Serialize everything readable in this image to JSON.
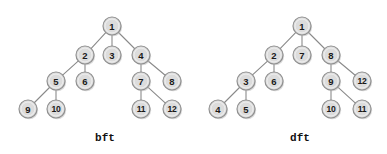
{
  "figure": {
    "background_color": "#ffffff",
    "width": 387,
    "height": 154
  },
  "style": {
    "node_fill": "#dcdcdc",
    "node_stroke": "#8f8f8f",
    "node_radius": 9,
    "edge_color": "#8a8a8a",
    "label_color": "#1a1a1a",
    "caption_color": "#111111"
  },
  "chart_data": {
    "type": "diagram",
    "title": "",
    "diagrams": [
      {
        "id": "bft",
        "caption": "bft",
        "caption_x": 105,
        "caption_y": 141,
        "nodes": [
          {
            "label": "1",
            "x": 112,
            "y": 26
          },
          {
            "label": "2",
            "x": 85,
            "y": 55
          },
          {
            "label": "3",
            "x": 112,
            "y": 55
          },
          {
            "label": "4",
            "x": 141,
            "y": 55
          },
          {
            "label": "5",
            "x": 56,
            "y": 81
          },
          {
            "label": "6",
            "x": 85,
            "y": 81
          },
          {
            "label": "7",
            "x": 141,
            "y": 81
          },
          {
            "label": "8",
            "x": 172,
            "y": 81
          },
          {
            "label": "9",
            "x": 28,
            "y": 109
          },
          {
            "label": "10",
            "x": 56,
            "y": 109
          },
          {
            "label": "11",
            "x": 141,
            "y": 109
          },
          {
            "label": "12",
            "x": 172,
            "y": 109
          }
        ],
        "edges": [
          {
            "from": "1",
            "to": "2"
          },
          {
            "from": "1",
            "to": "3"
          },
          {
            "from": "1",
            "to": "4"
          },
          {
            "from": "2",
            "to": "5"
          },
          {
            "from": "2",
            "to": "6"
          },
          {
            "from": "4",
            "to": "7"
          },
          {
            "from": "4",
            "to": "8"
          },
          {
            "from": "5",
            "to": "9"
          },
          {
            "from": "5",
            "to": "10"
          },
          {
            "from": "7",
            "to": "11"
          },
          {
            "from": "7",
            "to": "12"
          }
        ]
      },
      {
        "id": "dft",
        "caption": "dft",
        "caption_x": 300,
        "caption_y": 141,
        "nodes": [
          {
            "label": "1",
            "x": 302,
            "y": 26
          },
          {
            "label": "2",
            "x": 274,
            "y": 55
          },
          {
            "label": "7",
            "x": 302,
            "y": 55
          },
          {
            "label": "8",
            "x": 331,
            "y": 55
          },
          {
            "label": "3",
            "x": 246,
            "y": 81
          },
          {
            "label": "6",
            "x": 274,
            "y": 81
          },
          {
            "label": "9",
            "x": 331,
            "y": 81
          },
          {
            "label": "12",
            "x": 362,
            "y": 81
          },
          {
            "label": "4",
            "x": 218,
            "y": 109
          },
          {
            "label": "5",
            "x": 246,
            "y": 109
          },
          {
            "label": "10",
            "x": 331,
            "y": 109
          },
          {
            "label": "11",
            "x": 362,
            "y": 109
          }
        ],
        "edges": [
          {
            "from": "1",
            "to": "2"
          },
          {
            "from": "1",
            "to": "7"
          },
          {
            "from": "1",
            "to": "8"
          },
          {
            "from": "2",
            "to": "3"
          },
          {
            "from": "2",
            "to": "6"
          },
          {
            "from": "8",
            "to": "9"
          },
          {
            "from": "8",
            "to": "12"
          },
          {
            "from": "3",
            "to": "4"
          },
          {
            "from": "3",
            "to": "5"
          },
          {
            "from": "9",
            "to": "10"
          },
          {
            "from": "9",
            "to": "11"
          }
        ]
      }
    ]
  }
}
